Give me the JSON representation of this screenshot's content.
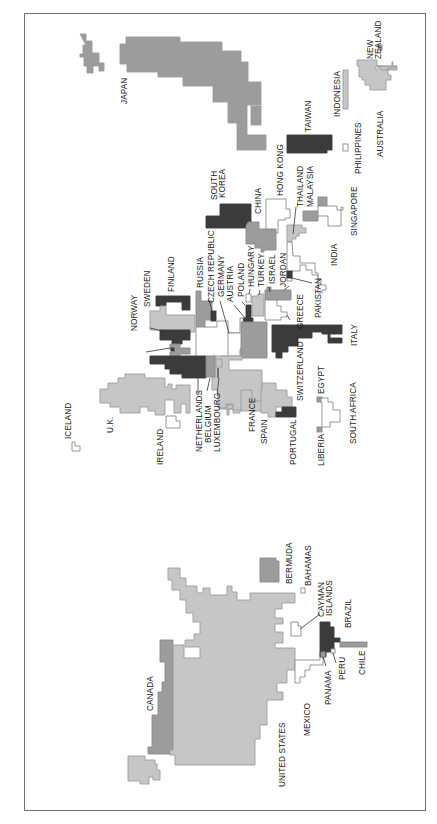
{
  "map": {
    "type": "cartogram",
    "orientation": "rotated-90-ccw",
    "shades": {
      "dark": "#3b3b3b",
      "medium": "#9c9c9c",
      "light": "#c6c6c6",
      "white": "#ffffff",
      "outline": "#8a8a8a",
      "frame": "#6e6e6e"
    },
    "countries": [
      {
        "name": "JAPAN",
        "shade": "medium"
      },
      {
        "name": "TAIWAN",
        "shade": "dark"
      },
      {
        "name": "INDONESIA",
        "shade": "light"
      },
      {
        "name": "NEW ZEALAND",
        "shade": "medium"
      },
      {
        "name": "AUSTRALIA",
        "shade": "light"
      },
      {
        "name": "PHILIPPINES",
        "shade": "white"
      },
      {
        "name": "HONG KONG",
        "shade": "white"
      },
      {
        "name": "SOUTH KOREA",
        "shade": "dark"
      },
      {
        "name": "CHINA",
        "shade": "medium"
      },
      {
        "name": "THAILAND",
        "shade": "light"
      },
      {
        "name": "MALAYSIA",
        "shade": "medium"
      },
      {
        "name": "SINGAPORE",
        "shade": "white"
      },
      {
        "name": "INDIA",
        "shade": "white"
      },
      {
        "name": "PAKISTAN",
        "shade": "dark"
      },
      {
        "name": "JORDAN",
        "shade": "medium"
      },
      {
        "name": "ISRAEL",
        "shade": "medium"
      },
      {
        "name": "TURKEY",
        "shade": "light"
      },
      {
        "name": "HUNGARY",
        "shade": "white"
      },
      {
        "name": "POLAND",
        "shade": "dark"
      },
      {
        "name": "AUSTRIA",
        "shade": "white"
      },
      {
        "name": "GERMANY",
        "shade": "white"
      },
      {
        "name": "CZECH REPUBLIC",
        "shade": "dark"
      },
      {
        "name": "RUSSIA",
        "shade": "medium"
      },
      {
        "name": "FINLAND",
        "shade": "dark"
      },
      {
        "name": "SWEDEN",
        "shade": "light"
      },
      {
        "name": "NORWAY",
        "shade": "dark"
      },
      {
        "name": "GREECE",
        "shade": "white"
      },
      {
        "name": "ITALY",
        "shade": "dark"
      },
      {
        "name": "SWITZERLAND",
        "shade": "medium"
      },
      {
        "name": "FRANCE",
        "shade": "light"
      },
      {
        "name": "SPAIN",
        "shade": "light"
      },
      {
        "name": "PORTUGAL",
        "shade": "dark"
      },
      {
        "name": "NETHERLANDS",
        "shade": "dark"
      },
      {
        "name": "BELGIUM",
        "shade": "medium"
      },
      {
        "name": "LUXEMBOURG",
        "shade": "light"
      },
      {
        "name": "U.K.",
        "shade": "light"
      },
      {
        "name": "IRELAND",
        "shade": "white"
      },
      {
        "name": "ICELAND",
        "shade": "white"
      },
      {
        "name": "EGYPT",
        "shade": "medium"
      },
      {
        "name": "LIBERIA",
        "shade": "medium"
      },
      {
        "name": "SOUTH AFRICA",
        "shade": "white"
      },
      {
        "name": "CANADA",
        "shade": "medium"
      },
      {
        "name": "UNITED STATES",
        "shade": "light"
      },
      {
        "name": "MEXICO",
        "shade": "white"
      },
      {
        "name": "BERMUDA",
        "shade": "medium"
      },
      {
        "name": "BAHAMAS",
        "shade": "white"
      },
      {
        "name": "CAYMAN ISLANDS",
        "shade": "white"
      },
      {
        "name": "BRAZIL",
        "shade": "dark"
      },
      {
        "name": "PANAMA",
        "shade": "medium"
      },
      {
        "name": "PERU",
        "shade": "white"
      },
      {
        "name": "CHILE",
        "shade": "medium"
      }
    ]
  },
  "labels": {
    "japan": "JAPAN",
    "taiwan": "TAIWAN",
    "indonesia": "INDONESIA",
    "new_zealand_1": "NEW",
    "new_zealand_2": "ZEALAND",
    "australia": "AUSTRALIA",
    "philippines": "PHILIPPINES",
    "hong_kong": "HONG KONG",
    "south_korea_1": "SOUTH",
    "south_korea_2": "KOREA",
    "china": "CHINA",
    "thailand": "THAILAND",
    "malaysia": "MALAYSIA",
    "singapore": "SINGAPORE",
    "india": "INDIA",
    "pakistan": "PAKISTAN",
    "jordan": "JORDAN",
    "israel": "ISRAEL",
    "turkey": "TURKEY",
    "hungary": "HUNGARY",
    "poland": "POLAND",
    "austria": "AUSTRIA",
    "germany": "GERMANY",
    "czech": "CZECH REPUBLIC",
    "russia": "RUSSIA",
    "finland": "FINLAND",
    "sweden": "SWEDEN",
    "norway": "NORWAY",
    "greece": "GREECE",
    "italy": "ITALY",
    "switzerland": "SWITZERLAND",
    "france": "FRANCE",
    "spain": "SPAIN",
    "portugal": "PORTUGAL",
    "netherlands": "NETHERLANDS",
    "belgium": "BELGIUM",
    "luxembourg": "LUXEMBOURG",
    "uk": "U.K.",
    "ireland": "IRELAND",
    "iceland": "ICELAND",
    "egypt": "EGYPT",
    "liberia": "LIBERIA",
    "south_africa": "SOUTH AFRICA",
    "canada": "CANADA",
    "united_states": "UNITED STATES",
    "mexico": "MEXICO",
    "bermuda": "BERMUDA",
    "bahamas": "BAHAMAS",
    "cayman_1": "CAYMAN",
    "cayman_2": "ISLANDS",
    "brazil": "BRAZIL",
    "panama": "PANAMA",
    "peru": "PERU",
    "chile": "CHILE"
  }
}
